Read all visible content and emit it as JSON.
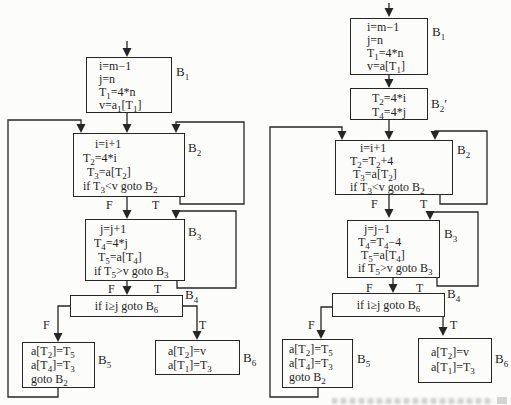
{
  "page_background": "#fcfcfb",
  "ink_color": "#262626",
  "charts": {
    "left": {
      "name": "original flow graph",
      "branch": {
        "f": "F",
        "t": "T"
      },
      "blocks": {
        "b1": {
          "label": "B_1",
          "lines": [
            "i=m−1",
            "j=n",
            "T_1=4*n",
            "v=a_1[T_1]"
          ]
        },
        "b2": {
          "label": "B_2",
          "lines": [
            "i=i+1",
            "T_2=4*i",
            "T_3=a[T_2]",
            "if T_3<v goto B_2"
          ]
        },
        "b3": {
          "label": "B_3",
          "lines": [
            "j=j+1",
            "T_4=4*j",
            "T_5=a[T_4]",
            "if T_5>v goto B_3"
          ]
        },
        "b4": {
          "label": "B_4",
          "lines": [
            "if i≥j goto B_6"
          ]
        },
        "b5": {
          "label": "B_5",
          "lines": [
            "a[T_2]=T_5",
            "a[T_4]=T_3",
            "goto B_2"
          ]
        },
        "b6": {
          "label": "B_6",
          "lines": [
            "a[T_2]=v",
            "a[T_1]=T_3"
          ]
        }
      }
    },
    "right": {
      "name": "flow graph after strength reduction",
      "branch": {
        "f": "F",
        "t": "T"
      },
      "blocks": {
        "b1": {
          "label": "B_1",
          "lines": [
            "i=m−1",
            "j=n",
            "T_1=4*n",
            "v=a[T_1]"
          ]
        },
        "b2p": {
          "label": "B_2′",
          "lines": [
            "T_2=4*i",
            "T_4=4*j"
          ]
        },
        "b2": {
          "label": "B_2",
          "lines": [
            "i=i+1",
            "T_2=T_2+4",
            "T_3=a[T_2]",
            "if T_3<v goto B_2"
          ]
        },
        "b3": {
          "label": "B_3",
          "lines": [
            "j=j−1",
            "T_4=T_4−4",
            "T_5=a[T_4]",
            "if T_5>v goto B_3"
          ]
        },
        "b4": {
          "label": "B_4",
          "lines": [
            "if i≥j goto B_6"
          ]
        },
        "b5": {
          "label": "B_5",
          "lines": [
            "a[T_2]=T_5",
            "a[T_4]=T_3",
            "goto B_2"
          ]
        },
        "b6": {
          "label": "B_6",
          "lines": [
            "a[T_2]=v",
            "a[T_1]=T_3"
          ]
        }
      }
    }
  }
}
